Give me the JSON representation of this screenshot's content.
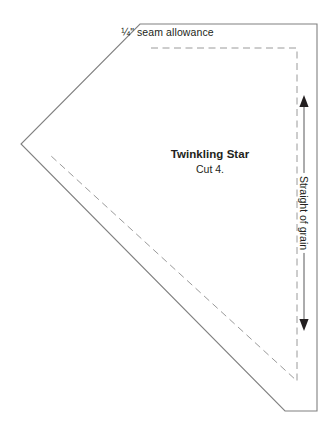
{
  "document": {
    "type": "quilting-pattern-template",
    "piece_name": "Twinkling Star",
    "cut_instruction": "Cut 4.",
    "seam_allowance": "¼\" seam allowance",
    "grain_direction": "Straight of grain"
  },
  "colors": {
    "cut_line": "#808080",
    "seam_line": "#9a9a9a",
    "grain_arrow": "#58585a",
    "text": "#231f20",
    "background": "#ffffff"
  },
  "shape": {
    "cut_line_points": "140,24 317,24 317,411 285,411 21,144",
    "seam_line_points": "151,48 297,48 297,381 50,155",
    "grain_arrow": {
      "x": 304,
      "y_top": 96,
      "y_bottom": 330
    }
  },
  "icons": {
    "arrow_up": "arrow-up-icon",
    "arrow_down": "arrow-down-icon"
  }
}
